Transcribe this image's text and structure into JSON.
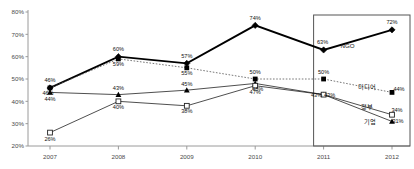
{
  "chart_data": {
    "type": "line",
    "title": "",
    "xlabel": "",
    "ylabel": "",
    "categories": [
      "2007",
      "2008",
      "2009",
      "2010",
      "2011",
      "2012"
    ],
    "ylim": [
      20,
      80
    ],
    "yticks": [
      "20%",
      "30%",
      "40%",
      "50%",
      "60%",
      "70%",
      "80%"
    ],
    "ytick_values": [
      20,
      30,
      40,
      50,
      60,
      70,
      80
    ],
    "grid": false,
    "legend_position": "inline-right",
    "series": [
      {
        "name": "NGO",
        "marker": "filled-diamond",
        "line": "thick-solid",
        "values": [
          46,
          60,
          57,
          74,
          63,
          72
        ],
        "labels": [
          "46%",
          "60%",
          "57%",
          "74%",
          "63%",
          "72%"
        ],
        "end_label": "NGO"
      },
      {
        "name": "미디어",
        "marker": "filled-square",
        "line": "dotted",
        "values": [
          46,
          59,
          55,
          50,
          50,
          44
        ],
        "labels": [
          "46%",
          "59%",
          "55%",
          "50%",
          "50%",
          "44%"
        ],
        "end_label": "미디어"
      },
      {
        "name": "기업",
        "marker": "filled-triangle",
        "line": "thin-solid",
        "values": [
          44,
          43,
          45,
          48,
          43,
          31
        ],
        "labels": [
          "44%",
          "43%",
          "45%",
          "48%",
          "43%",
          "31%"
        ],
        "end_label": "기업"
      },
      {
        "name": "정부",
        "marker": "open-square",
        "line": "thin-solid",
        "values": [
          26,
          40,
          38,
          47,
          43,
          34
        ],
        "labels": [
          "26%",
          "40%",
          "38%",
          "47%",
          "43%",
          "34%"
        ],
        "end_label": "정부"
      }
    ],
    "highlight_box": {
      "from": "2011",
      "to": "2012",
      "visible": true
    }
  }
}
